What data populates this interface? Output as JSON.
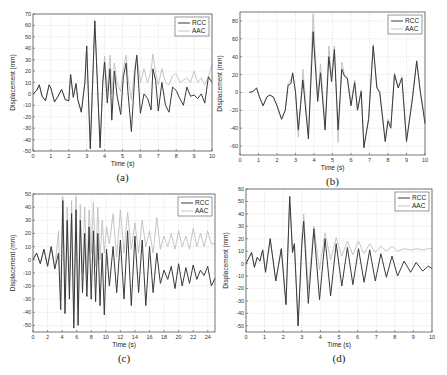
{
  "figure": {
    "legend": {
      "rcc_label": "RCC",
      "aac_label": "AAC"
    },
    "colors": {
      "rcc": "#3a3a3a",
      "aac": "#b8b8b8",
      "grid": "#d6d6d6",
      "axis": "#555555"
    }
  },
  "chart_data": [
    {
      "id": "a",
      "caption": "(a)",
      "type": "line",
      "title": "",
      "xlabel": "Time (s)",
      "ylabel": "Displacement (mm)",
      "xlim": [
        0,
        10
      ],
      "ylim": [
        -50,
        70
      ],
      "xticks": [
        0,
        1,
        2,
        3,
        4,
        5,
        6,
        7,
        8,
        9,
        10
      ],
      "yticks": [
        -50,
        -40,
        -30,
        -20,
        -10,
        0,
        10,
        20,
        30,
        40,
        50,
        60,
        70
      ],
      "grid": true,
      "legend_position": "upper right",
      "box": {
        "x": 33,
        "y": 14,
        "w": 179,
        "h": 137
      },
      "series": [
        {
          "name": "RCC",
          "x": [
            0,
            0.2,
            0.35,
            0.5,
            0.7,
            0.9,
            1.0,
            1.2,
            1.4,
            1.6,
            1.8,
            2.0,
            2.1,
            2.25,
            2.4,
            2.5,
            2.7,
            2.9,
            3.0,
            3.2,
            3.45,
            3.75,
            3.9,
            4.0,
            4.15,
            4.3,
            4.4,
            4.55,
            4.7,
            4.9,
            5.05,
            5.2,
            5.3,
            5.5,
            5.7,
            5.8,
            6.0,
            6.2,
            6.4,
            6.6,
            6.7,
            6.85,
            7.0,
            7.2,
            7.4,
            7.6,
            7.8,
            8.0,
            8.2,
            8.4,
            8.6,
            8.8,
            9.0,
            9.2,
            9.4,
            9.6,
            9.8,
            10.0
          ],
          "y": [
            0,
            3,
            8,
            -2,
            -6,
            8,
            5,
            -7,
            -2,
            4,
            -5,
            -6,
            17,
            -3,
            9,
            -5,
            -16,
            10,
            42,
            -48,
            64,
            -47,
            10,
            28,
            -8,
            22,
            -23,
            20,
            -2,
            -18,
            15,
            27,
            2,
            -33,
            20,
            34,
            -17,
            0,
            -4,
            -14,
            22,
            12,
            -15,
            10,
            -10,
            -16,
            6,
            3,
            -4,
            -10,
            6,
            -2,
            -1,
            -4,
            0,
            -8,
            15,
            10
          ]
        },
        {
          "name": "AAC",
          "x": [
            0,
            0.2,
            0.35,
            0.5,
            0.7,
            0.9,
            1.0,
            1.2,
            1.4,
            1.6,
            1.8,
            2.0,
            2.1,
            2.25,
            2.4,
            2.5,
            2.7,
            2.9,
            3.0,
            3.2,
            3.45,
            3.75,
            3.9,
            4.0,
            4.15,
            4.3,
            4.4,
            4.55,
            4.7,
            4.9,
            5.05,
            5.2,
            5.3,
            5.5,
            5.7,
            5.8,
            6.0,
            6.2,
            6.4,
            6.6,
            6.7,
            6.85,
            7.0,
            7.2,
            7.4,
            7.6,
            7.8,
            8.0,
            8.2,
            8.4,
            8.6,
            8.8,
            9.0,
            9.2,
            9.4,
            9.6,
            9.8,
            10.0
          ],
          "y": [
            0,
            3,
            8,
            -2,
            -6,
            8,
            5,
            -7,
            -2,
            4,
            -5,
            -6,
            17,
            -3,
            9,
            -5,
            -16,
            10,
            42,
            -48,
            64,
            -47,
            12,
            33,
            2,
            34,
            0,
            27,
            10,
            2,
            22,
            34,
            15,
            -5,
            25,
            33,
            10,
            22,
            10,
            20,
            35,
            18,
            8,
            22,
            10,
            8,
            16,
            18,
            10,
            12,
            14,
            10,
            20,
            10,
            14,
            8,
            15,
            26
          ]
        }
      ]
    },
    {
      "id": "b",
      "caption": "(b)",
      "type": "line",
      "title": "",
      "xlabel": "Time (s)",
      "ylabel": "Displacement (mm)",
      "xlim": [
        0,
        10
      ],
      "ylim": [
        -70,
        90
      ],
      "xticks": [
        0,
        1,
        2,
        3,
        4,
        5,
        6,
        7,
        8,
        9,
        10
      ],
      "yticks": [
        -60,
        -40,
        -20,
        0,
        20,
        40,
        60,
        80
      ],
      "grid": true,
      "legend_position": "upper right",
      "box": {
        "x": 240,
        "y": 12,
        "w": 185,
        "h": 143
      },
      "series": [
        {
          "name": "RCC",
          "x": [
            0.5,
            0.7,
            0.9,
            1.05,
            1.25,
            1.45,
            1.6,
            1.8,
            2.0,
            2.25,
            2.45,
            2.6,
            2.75,
            2.85,
            3.0,
            3.15,
            3.4,
            3.7,
            3.95,
            4.2,
            4.35,
            4.6,
            4.8,
            4.95,
            5.1,
            5.3,
            5.5,
            5.65,
            5.8,
            6.0,
            6.2,
            6.35,
            6.55,
            6.7,
            6.95,
            7.2,
            7.4,
            7.55,
            7.85,
            8.0,
            8.15,
            8.35,
            8.55,
            8.75,
            9.0,
            9.3,
            9.55,
            9.75,
            9.9,
            10.0
          ],
          "y": [
            0,
            1,
            5,
            -5,
            -15,
            -5,
            -3,
            -5,
            -15,
            -30,
            -20,
            8,
            10,
            22,
            0,
            -42,
            14,
            -52,
            68,
            -10,
            22,
            -42,
            40,
            12,
            48,
            -42,
            26,
            18,
            16,
            -15,
            11,
            -20,
            1,
            -62,
            -30,
            52,
            5,
            0,
            -55,
            -32,
            -40,
            20,
            5,
            16,
            -55,
            -10,
            35,
            0,
            -20,
            -35
          ]
        },
        {
          "name": "AAC",
          "x": [
            0.5,
            0.7,
            0.9,
            1.05,
            1.25,
            1.45,
            1.6,
            1.8,
            2.0,
            2.25,
            2.45,
            2.6,
            2.75,
            2.85,
            3.0,
            3.15,
            3.4,
            3.7,
            3.95,
            4.2,
            4.35,
            4.6,
            4.8,
            4.95,
            5.1,
            5.3,
            5.5,
            5.65,
            5.8,
            6.0,
            6.2,
            6.35,
            6.55,
            6.7,
            6.95,
            7.2,
            7.4,
            7.55,
            7.85,
            8.0,
            8.15,
            8.35,
            8.55,
            8.75,
            9.0,
            9.3,
            9.55,
            9.75,
            9.9,
            10.0
          ],
          "y": [
            0,
            1,
            5,
            -5,
            -15,
            -5,
            -3,
            -5,
            -15,
            -30,
            -18,
            10,
            14,
            20,
            2,
            -50,
            26,
            -48,
            88,
            -6,
            32,
            -38,
            52,
            16,
            52,
            -56,
            34,
            20,
            16,
            -12,
            14,
            -18,
            3,
            -60,
            -28,
            54,
            6,
            2,
            -52,
            -30,
            -38,
            22,
            6,
            18,
            -53,
            -8,
            36,
            0,
            -18,
            -33
          ]
        }
      ]
    },
    {
      "id": "c",
      "caption": "(c)",
      "type": "line",
      "title": "",
      "xlabel": "Time (s)",
      "ylabel": "Displacement (mm)",
      "xlim": [
        0,
        25
      ],
      "ylim": [
        -55,
        50
      ],
      "xticks": [
        0,
        2,
        4,
        6,
        8,
        10,
        12,
        14,
        16,
        18,
        20,
        22,
        24
      ],
      "yticks": [
        -50,
        -40,
        -30,
        -20,
        -10,
        0,
        10,
        20,
        30,
        40,
        50
      ],
      "grid": true,
      "legend_position": "upper right",
      "box": {
        "x": 33,
        "y": 194,
        "w": 182,
        "h": 138
      },
      "series": [
        {
          "name": "RCC",
          "x": [
            0,
            0.5,
            1,
            1.5,
            2,
            2.5,
            3,
            3.5,
            3.8,
            4.1,
            4.4,
            4.7,
            5.0,
            5.3,
            5.6,
            5.9,
            6.2,
            6.5,
            6.8,
            7.1,
            7.4,
            7.7,
            8.0,
            8.3,
            8.6,
            8.9,
            9.2,
            9.5,
            9.8,
            10.1,
            10.5,
            11,
            11.5,
            12,
            12.5,
            13,
            13.5,
            14,
            14.5,
            15,
            15.5,
            16,
            16.5,
            17,
            17.5,
            18,
            18.5,
            19,
            19.5,
            20,
            20.5,
            21,
            21.5,
            22,
            22.5,
            23,
            23.5,
            24,
            24.5,
            25
          ],
          "y": [
            0,
            5,
            -3,
            8,
            -5,
            10,
            -7,
            5,
            -38,
            45,
            -41,
            30,
            -30,
            35,
            -52,
            38,
            -50,
            30,
            -25,
            20,
            -28,
            25,
            -30,
            22,
            -32,
            20,
            -35,
            5,
            -42,
            8,
            -20,
            10,
            -25,
            15,
            -30,
            22,
            -35,
            18,
            -25,
            15,
            -35,
            10,
            -25,
            5,
            -18,
            -8,
            -15,
            -5,
            -22,
            -3,
            -20,
            -6,
            -18,
            -4,
            -15,
            -8,
            -12,
            -5,
            -20,
            -14
          ]
        },
        {
          "name": "AAC",
          "x": [
            0,
            0.5,
            1,
            1.5,
            2,
            2.5,
            3,
            3.5,
            3.8,
            4.1,
            4.4,
            4.7,
            5.0,
            5.3,
            5.6,
            5.9,
            6.2,
            6.5,
            6.8,
            7.1,
            7.4,
            7.7,
            8.0,
            8.3,
            8.6,
            8.9,
            9.2,
            9.5,
            9.8,
            10.1,
            10.5,
            11,
            11.5,
            12,
            12.5,
            13,
            13.5,
            14,
            14.5,
            15,
            15.5,
            16,
            16.5,
            17,
            17.5,
            18,
            18.5,
            19,
            19.5,
            20,
            20.5,
            21,
            21.5,
            22,
            22.5,
            23,
            23.5,
            24,
            24.5,
            25
          ],
          "y": [
            0,
            5,
            -3,
            8,
            -5,
            10,
            -7,
            22,
            -30,
            48,
            -30,
            40,
            -20,
            45,
            -40,
            48,
            -35,
            42,
            -10,
            40,
            -12,
            38,
            5,
            44,
            -5,
            40,
            0,
            30,
            5,
            25,
            12,
            35,
            2,
            38,
            5,
            36,
            8,
            28,
            5,
            30,
            10,
            22,
            5,
            32,
            8,
            18,
            10,
            20,
            8,
            22,
            10,
            18,
            8,
            24,
            10,
            20,
            10,
            22,
            12,
            12
          ]
        }
      ]
    },
    {
      "id": "d",
      "caption": "(d)",
      "type": "line",
      "title": "",
      "xlabel": "Time (s)",
      "ylabel": "Displacement (mm)",
      "xlim": [
        0,
        10
      ],
      "ylim": [
        -55,
        60
      ],
      "xticks": [
        0,
        1,
        2,
        3,
        4,
        5,
        6,
        7,
        8,
        9,
        10
      ],
      "yticks": [
        -50,
        -40,
        -30,
        -20,
        -10,
        0,
        10,
        20,
        30,
        40,
        50,
        60
      ],
      "grid": true,
      "legend_position": "upper right",
      "box": {
        "x": 246,
        "y": 189,
        "w": 186,
        "h": 143
      },
      "series": [
        {
          "name": "RCC",
          "x": [
            0,
            0.3,
            0.45,
            0.6,
            0.75,
            0.9,
            1.05,
            1.3,
            1.6,
            1.9,
            2.15,
            2.35,
            2.5,
            2.6,
            2.8,
            3.0,
            3.1,
            3.35,
            3.65,
            3.95,
            4.25,
            4.55,
            4.85,
            5.15,
            5.45,
            5.75,
            6.05,
            6.35,
            6.65,
            6.95,
            7.25,
            7.55,
            7.85,
            8.15,
            8.5,
            8.85,
            9.15,
            9.5,
            9.8,
            10.0
          ],
          "y": [
            0,
            9,
            -3,
            5,
            2,
            11,
            -7,
            20,
            -14,
            12,
            -33,
            54,
            9,
            16,
            -50,
            15,
            34,
            -32,
            28,
            -29,
            20,
            -26,
            16,
            -18,
            13,
            -17,
            12,
            -15,
            11,
            -14,
            8,
            -11,
            6,
            -10,
            2,
            -7,
            1,
            -6,
            -2,
            -4
          ]
        },
        {
          "name": "AAC",
          "x": [
            0,
            0.3,
            0.45,
            0.6,
            0.75,
            0.9,
            1.05,
            1.3,
            1.6,
            1.9,
            2.15,
            2.35,
            2.5,
            2.6,
            2.8,
            3.0,
            3.1,
            3.35,
            3.65,
            3.95,
            4.25,
            4.55,
            4.85,
            5.15,
            5.45,
            5.75,
            6.05,
            6.35,
            6.65,
            6.95,
            7.25,
            7.55,
            7.85,
            8.15,
            8.5,
            8.85,
            9.15,
            9.5,
            9.8,
            10.0
          ],
          "y": [
            0,
            9,
            -3,
            5,
            2,
            11,
            -7,
            20,
            -14,
            12,
            -33,
            54,
            9,
            16,
            -50,
            18,
            40,
            -20,
            30,
            -5,
            25,
            3,
            21,
            6,
            18,
            7,
            18,
            8,
            16,
            9,
            14,
            10,
            14,
            10,
            12,
            11,
            12,
            11,
            12,
            12
          ]
        }
      ]
    }
  ]
}
